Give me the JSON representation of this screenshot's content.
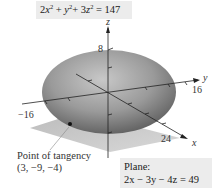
{
  "figure": {
    "ellipsoid_equation": {
      "term1_coef": "2",
      "term1_var": "x",
      "term1_exp": "2",
      "plus1": " + ",
      "term2_var": "y",
      "term2_exp": "2",
      "plus2": "+ ",
      "term3_coef": "3",
      "term3_var": "z",
      "term3_exp": "2",
      "rhs": " = 147",
      "full": "2x² + y² + 3z² = 147"
    },
    "axes": {
      "z_label": "z",
      "y_label": "y",
      "x_label": "x",
      "z_tick": "8",
      "y_tick": "16",
      "neg_y_tick": "−16",
      "x_tick": "24"
    },
    "point": {
      "label_line1": "Point of tangency",
      "label_line2": "(3, −9, −4)"
    },
    "plane": {
      "title": "Plane:",
      "equation": "2x − 3y − 4z = 49"
    },
    "colors": {
      "ellipsoid_dark": "#555555",
      "ellipsoid_light": "#b0b0b0",
      "plane": "#c4c4c4",
      "label_box": "#ececec",
      "axis": "#222222"
    }
  }
}
